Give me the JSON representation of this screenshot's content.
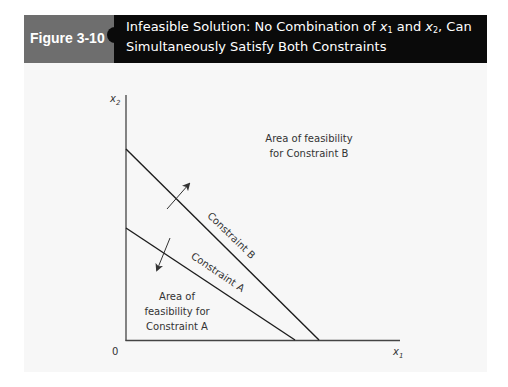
{
  "figure": {
    "label": "Figure 3-10",
    "title_parts": {
      "line1_prefix": "Infeasible Solution: No Combination of ",
      "var1": "x",
      "var1_sub": "1",
      "and": " and ",
      "var2": "x",
      "var2_sub": "2",
      "line1_suffix": ", Can",
      "line2": "Simultaneously Satisfy Both Constraints"
    },
    "colors": {
      "label_bg": "#6e6e6e",
      "title_bg": "#0a0a0a",
      "panel_bg": "#f7f7f7",
      "line": "#222222"
    }
  },
  "diagram": {
    "axes": {
      "origin_label": "0",
      "x_label": "x",
      "x_label_sub": "1",
      "y_label": "x",
      "y_label_sub": "2"
    },
    "constraints": [
      {
        "name": "Constraint A",
        "label": "Constraint A",
        "y_intercept_px": 228,
        "x_intercept_px": 295,
        "feasible_direction": "toward origin"
      },
      {
        "name": "Constraint B",
        "label": "Constraint B",
        "y_intercept_px": 149,
        "x_intercept_px": 319,
        "feasible_direction": "away from origin"
      }
    ],
    "regions": {
      "area_b_line1": "Area of feasibility",
      "area_b_line2": "for Constraint B",
      "area_a_line1": "Area of",
      "area_a_line2": "feasibility for",
      "area_a_line3": "Constraint A"
    }
  }
}
